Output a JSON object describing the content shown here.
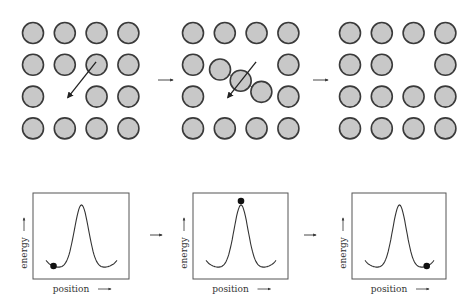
{
  "figure": {
    "top_row": {
      "panels": [
        {
          "id": "initial",
          "grid_size": [
            4,
            4
          ],
          "vacancy": [
            2,
            1
          ],
          "regular_atoms": [
            [
              0,
              0
            ],
            [
              0,
              1
            ],
            [
              0,
              2
            ],
            [
              0,
              3
            ],
            [
              1,
              0
            ],
            [
              1,
              1
            ],
            [
              1,
              2
            ],
            [
              1,
              3
            ],
            [
              2,
              0
            ],
            [
              2,
              2
            ],
            [
              2,
              3
            ],
            [
              3,
              0
            ],
            [
              3,
              1
            ],
            [
              3,
              2
            ],
            [
              3,
              3
            ]
          ],
          "hop_arrow": {
            "from": [
              1,
              2
            ],
            "to": [
              2,
              1
            ]
          }
        },
        {
          "id": "transition",
          "grid_size": [
            4,
            4
          ],
          "regular_atoms": [
            [
              0,
              0
            ],
            [
              0,
              1
            ],
            [
              0,
              2
            ],
            [
              0,
              3
            ],
            [
              1,
              0
            ],
            [
              1,
              3
            ],
            [
              2,
              0
            ],
            [
              2,
              3
            ],
            [
              3,
              0
            ],
            [
              3,
              1
            ],
            [
              3,
              2
            ],
            [
              3,
              3
            ]
          ],
          "displaced_neighbors": [
            [
              1.15,
              0.85
            ],
            [
              1.85,
              2.15
            ]
          ],
          "migrating_atom": [
            1.5,
            1.5
          ],
          "hop_arrow": {
            "from": [
              1,
              2
            ],
            "to": [
              2,
              1
            ]
          }
        },
        {
          "id": "final",
          "grid_size": [
            4,
            4
          ],
          "vacancy": [
            1,
            2
          ],
          "regular_atoms": [
            [
              0,
              0
            ],
            [
              0,
              1
            ],
            [
              0,
              2
            ],
            [
              0,
              3
            ],
            [
              1,
              0
            ],
            [
              1,
              1
            ],
            [
              1,
              3
            ],
            [
              2,
              0
            ],
            [
              2,
              1
            ],
            [
              2,
              2
            ],
            [
              2,
              3
            ],
            [
              3,
              0
            ],
            [
              3,
              1
            ],
            [
              3,
              2
            ],
            [
              3,
              3
            ]
          ]
        }
      ],
      "transition_arrows": [
        "arrow-icon",
        "arrow-icon"
      ]
    },
    "bottom_row": {
      "panels": [
        {
          "id": "energy-initial",
          "ylabel": "energy",
          "xlabel": "position",
          "ball_position": "left-minimum"
        },
        {
          "id": "energy-transition",
          "ylabel": "energy",
          "xlabel": "position",
          "ball_position": "barrier-top"
        },
        {
          "id": "energy-final",
          "ylabel": "energy",
          "xlabel": "position",
          "ball_position": "right-minimum"
        }
      ],
      "transition_arrows": [
        "arrow-icon",
        "arrow-icon"
      ]
    },
    "colors": {
      "atom_fill": "#c8c8c8",
      "atom_stroke": "#3a3a3a",
      "ink": "#222222",
      "ball": "#111111"
    }
  }
}
